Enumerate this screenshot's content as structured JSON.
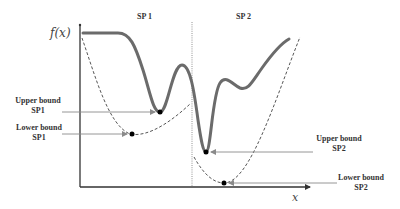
{
  "diagram": {
    "y_axis_label": "f(x)",
    "x_axis_label": "x",
    "regions": [
      {
        "label": "SP 1"
      },
      {
        "label": "SP 2"
      }
    ],
    "annotations": {
      "upper_sp1": {
        "line1": "Upper bound",
        "line2": "SP1"
      },
      "lower_sp1": {
        "line1": "Lower bound",
        "line2": "SP1"
      },
      "upper_sp2": {
        "line1": "Upper bound",
        "line2": "SP2"
      },
      "lower_sp2": {
        "line1": "Lower bound",
        "line2": "SP2"
      }
    },
    "colors": {
      "objective_curve": "#6b6b6b",
      "relaxation_curve": "#555555",
      "axis": "#333333",
      "arrow": "#8a8a8a",
      "point": "#000000"
    }
  }
}
